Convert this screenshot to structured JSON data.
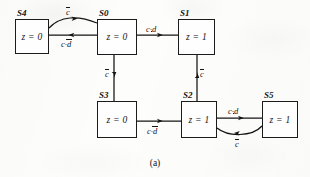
{
  "figure": {
    "caption": "(a)",
    "kind": "state-transition-diagram",
    "ink_color": "#141414",
    "paper_color": "#fdfdfc"
  },
  "states": [
    {
      "id": "S4",
      "name": "S4",
      "output": "z = 0",
      "box": {
        "x": 15,
        "y": 19,
        "w": 34,
        "h": 35
      },
      "name_pos": {
        "x": 17,
        "y": 8
      }
    },
    {
      "id": "S0",
      "name": "S0",
      "output": "z = 0",
      "box": {
        "x": 97,
        "y": 19,
        "w": 40,
        "h": 36
      },
      "name_pos": {
        "x": 99,
        "y": 8
      }
    },
    {
      "id": "S1",
      "name": "S1",
      "output": "z = 1",
      "box": {
        "x": 178,
        "y": 19,
        "w": 37,
        "h": 36
      },
      "name_pos": {
        "x": 180,
        "y": 8
      }
    },
    {
      "id": "S3",
      "name": "S3",
      "output": "z = 0",
      "box": {
        "x": 97,
        "y": 101,
        "w": 40,
        "h": 37
      },
      "name_pos": {
        "x": 99,
        "y": 90
      }
    },
    {
      "id": "S2",
      "name": "S2",
      "output": "z = 1",
      "box": {
        "x": 181,
        "y": 101,
        "w": 36,
        "h": 37
      },
      "name_pos": {
        "x": 183,
        "y": 90
      }
    },
    {
      "id": "S5",
      "name": "S5",
      "output": "z = 1",
      "box": {
        "x": 262,
        "y": 101,
        "w": 36,
        "h": 37
      },
      "name_pos": {
        "x": 264,
        "y": 90
      }
    }
  ],
  "transitions": [
    {
      "id": "t-s4-s0",
      "from": "S4",
      "to": "S0",
      "label": {
        "pre": "",
        "bar": "c",
        "post": ""
      },
      "label_text": "c̄",
      "shape": "curve-up",
      "label_pos": {
        "x": 66,
        "y": 8
      }
    },
    {
      "id": "t-s0-s4",
      "from": "S0",
      "to": "S4",
      "label": {
        "pre": "c·",
        "bar": "d",
        "post": ""
      },
      "label_text": "c·d̄",
      "shape": "straight-left",
      "label_pos": {
        "x": 63,
        "y": 40
      }
    },
    {
      "id": "t-s0-s1",
      "from": "S0",
      "to": "S1",
      "label": {
        "pre": "c·",
        "bar": "",
        "post": "d"
      },
      "label_text": "c·d",
      "shape": "straight-right",
      "label_pos": {
        "x": 146,
        "y": 26
      }
    },
    {
      "id": "t-s0-s3",
      "from": "S0",
      "to": "S3",
      "label": {
        "pre": "",
        "bar": "c",
        "post": ""
      },
      "label_text": "c̄",
      "shape": "vertical-down",
      "label_pos": {
        "x": 106,
        "y": 72
      }
    },
    {
      "id": "t-s2-s1",
      "from": "S2",
      "to": "S1",
      "label": {
        "pre": "",
        "bar": "c",
        "post": ""
      },
      "label_text": "c̄",
      "shape": "vertical-up",
      "label_pos": {
        "x": 200,
        "y": 72
      }
    },
    {
      "id": "t-s3-s2",
      "from": "S3",
      "to": "S2",
      "label": {
        "pre": "c·",
        "bar": "d",
        "post": ""
      },
      "label_text": "c·d̄",
      "shape": "straight-right",
      "label_pos": {
        "x": 149,
        "y": 128
      }
    },
    {
      "id": "t-s2-s5",
      "from": "S2",
      "to": "S5",
      "label": {
        "pre": "c·",
        "bar": "",
        "post": "d"
      },
      "label_text": "c·d",
      "shape": "straight-right",
      "label_pos": {
        "x": 228,
        "y": 108
      }
    },
    {
      "id": "t-s5-s2",
      "from": "S5",
      "to": "S2",
      "label": {
        "pre": "",
        "bar": "c",
        "post": ""
      },
      "label_text": "c̄",
      "shape": "curve-down",
      "label_pos": {
        "x": 235,
        "y": 142
      }
    }
  ]
}
